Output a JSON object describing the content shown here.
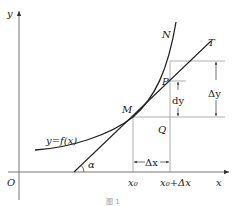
{
  "diagram": {
    "axes": {
      "x_label": "x",
      "y_label": "y",
      "origin_label": "O"
    },
    "curve": {
      "label": "y=f(x)",
      "end_label": "N"
    },
    "tangent": {
      "end_label": "T",
      "angle_label": "α"
    },
    "points": {
      "M": "M",
      "P": "P",
      "Q": "Q"
    },
    "x_ticks": {
      "x0": "x₀",
      "x0_plus_dx": "x₀+Δx"
    },
    "dimensions": {
      "delta_x": "Δx",
      "delta_y": "Δy",
      "dy": "dy"
    },
    "caption": "图 1",
    "colors": {
      "line": "#222222",
      "guide": "#888888"
    }
  }
}
